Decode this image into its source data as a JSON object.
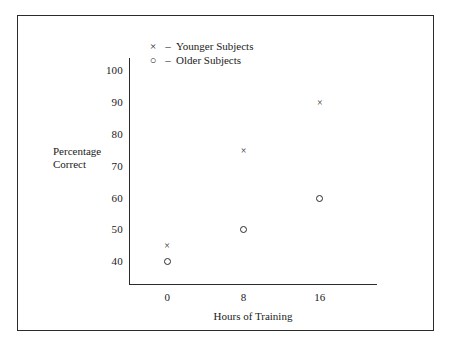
{
  "chart_data": {
    "type": "scatter",
    "title": "",
    "xlabel": "Hours of Training",
    "ylabel": "Percentage Correct",
    "ylabel_lines": [
      "Percentage",
      "Correct"
    ],
    "x": [
      0,
      8,
      16
    ],
    "xticklabels": [
      "0",
      "8",
      "16"
    ],
    "yticks": [
      40,
      50,
      60,
      70,
      80,
      90,
      100
    ],
    "yticklabels": [
      "40",
      "50",
      "60",
      "70",
      "80",
      "90",
      "100"
    ],
    "xlim": [
      -4,
      22
    ],
    "ylim": [
      33,
      104
    ],
    "grid": false,
    "legend_position": "upper-left-inside",
    "series": [
      {
        "name": "Younger Subjects",
        "marker": "x",
        "legend_marker": "×",
        "legend_dash": "–",
        "values": [
          45,
          75,
          90
        ]
      },
      {
        "name": "Older Subjects",
        "marker": "o",
        "legend_marker": "○",
        "legend_dash": "–",
        "values": [
          40,
          50,
          60
        ]
      }
    ],
    "points": [
      {
        "series": "Younger Subjects",
        "x": 0,
        "y": 45
      },
      {
        "series": "Younger Subjects",
        "x": 8,
        "y": 75
      },
      {
        "series": "Younger Subjects",
        "x": 16,
        "y": 90
      },
      {
        "series": "Older Subjects",
        "x": 0,
        "y": 40
      },
      {
        "series": "Older Subjects",
        "x": 8,
        "y": 50
      },
      {
        "series": "Older Subjects",
        "x": 16,
        "y": 60
      }
    ],
    "colors": {
      "axis": "#2b2b2b",
      "marker": "#2b2b2b",
      "frame": "#2b2b2b",
      "background": "#ffffff"
    }
  }
}
